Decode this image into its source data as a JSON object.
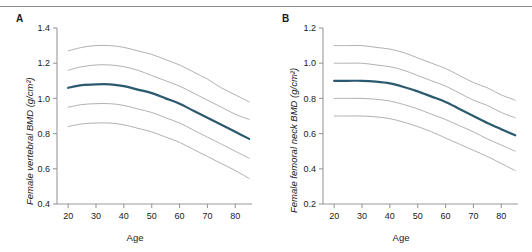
{
  "figure": {
    "panels": [
      {
        "letter": "A",
        "ylabel": "Female vertebral BMD (g/cm²)",
        "xlabel": "Age"
      },
      {
        "letter": "B",
        "ylabel": "Female femoral neck BMD (g/cm²)",
        "xlabel": "Age"
      }
    ]
  },
  "chart_data": [
    {
      "type": "line",
      "title": "",
      "panel_label": "A",
      "xlabel": "Age",
      "ylabel": "Female vertebral BMD (g/cm²)",
      "xlim": [
        16,
        86
      ],
      "ylim": [
        0.4,
        1.4
      ],
      "xticks": [
        20,
        30,
        40,
        50,
        60,
        70,
        80
      ],
      "yticks": [
        0.4,
        0.6,
        0.8,
        1.0,
        1.2,
        1.4
      ],
      "grid": false,
      "legend": "none",
      "x": [
        20,
        25,
        30,
        35,
        40,
        45,
        50,
        55,
        60,
        65,
        70,
        75,
        80,
        85
      ],
      "series": [
        {
          "name": "97th percentile",
          "style": "reference",
          "color": "#a8a8a8",
          "values": [
            1.27,
            1.29,
            1.3,
            1.3,
            1.29,
            1.27,
            1.25,
            1.22,
            1.19,
            1.15,
            1.11,
            1.06,
            1.02,
            0.98
          ]
        },
        {
          "name": "84th percentile",
          "style": "reference",
          "color": "#a8a8a8",
          "values": [
            1.16,
            1.18,
            1.19,
            1.19,
            1.18,
            1.16,
            1.13,
            1.1,
            1.07,
            1.03,
            0.99,
            0.95,
            0.91,
            0.88
          ]
        },
        {
          "name": "Median (50th percentile)",
          "style": "median",
          "color": "#2b5a6e",
          "values": [
            1.06,
            1.075,
            1.08,
            1.08,
            1.07,
            1.05,
            1.03,
            1.0,
            0.97,
            0.93,
            0.89,
            0.85,
            0.81,
            0.77
          ]
        },
        {
          "name": "16th percentile",
          "style": "reference",
          "color": "#a8a8a8",
          "values": [
            0.95,
            0.965,
            0.97,
            0.97,
            0.96,
            0.94,
            0.92,
            0.89,
            0.86,
            0.82,
            0.78,
            0.74,
            0.7,
            0.66
          ]
        },
        {
          "name": "3rd percentile",
          "style": "reference",
          "color": "#a8a8a8",
          "values": [
            0.84,
            0.855,
            0.86,
            0.86,
            0.85,
            0.83,
            0.81,
            0.78,
            0.75,
            0.71,
            0.67,
            0.63,
            0.59,
            0.545
          ]
        }
      ]
    },
    {
      "type": "line",
      "title": "",
      "panel_label": "B",
      "xlabel": "Age",
      "ylabel": "Female femoral neck BMD (g/cm²)",
      "xlim": [
        16,
        86
      ],
      "ylim": [
        0.2,
        1.2
      ],
      "xticks": [
        20,
        30,
        40,
        50,
        60,
        70,
        80
      ],
      "yticks": [
        0.2,
        0.4,
        0.6,
        0.8,
        1.0,
        1.2
      ],
      "grid": false,
      "legend": "none",
      "x": [
        20,
        25,
        30,
        35,
        40,
        45,
        50,
        55,
        60,
        65,
        70,
        75,
        80,
        85
      ],
      "series": [
        {
          "name": "97th percentile",
          "style": "reference",
          "color": "#a8a8a8",
          "values": [
            1.1,
            1.1,
            1.1,
            1.09,
            1.08,
            1.06,
            1.03,
            1.0,
            0.97,
            0.93,
            0.89,
            0.86,
            0.82,
            0.79
          ]
        },
        {
          "name": "84th percentile",
          "style": "reference",
          "color": "#a8a8a8",
          "values": [
            1.0,
            1.0,
            1.0,
            0.99,
            0.98,
            0.96,
            0.93,
            0.9,
            0.87,
            0.83,
            0.79,
            0.76,
            0.72,
            0.69
          ]
        },
        {
          "name": "Median (50th percentile)",
          "style": "median",
          "color": "#2b5a6e",
          "values": [
            0.9,
            0.9,
            0.9,
            0.895,
            0.885,
            0.865,
            0.84,
            0.81,
            0.78,
            0.74,
            0.7,
            0.66,
            0.625,
            0.59
          ]
        },
        {
          "name": "16th percentile",
          "style": "reference",
          "color": "#a8a8a8",
          "values": [
            0.8,
            0.8,
            0.8,
            0.795,
            0.785,
            0.765,
            0.74,
            0.71,
            0.68,
            0.645,
            0.61,
            0.57,
            0.535,
            0.5
          ]
        },
        {
          "name": "3rd percentile",
          "style": "reference",
          "color": "#a8a8a8",
          "values": [
            0.7,
            0.7,
            0.7,
            0.695,
            0.685,
            0.665,
            0.64,
            0.61,
            0.575,
            0.54,
            0.505,
            0.47,
            0.43,
            0.39
          ]
        }
      ]
    }
  ]
}
